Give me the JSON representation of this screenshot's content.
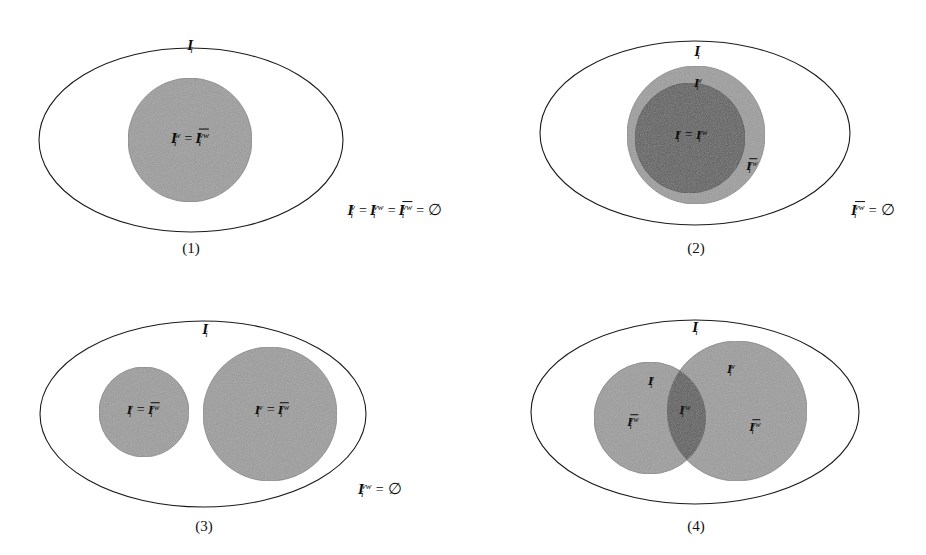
{
  "figure": {
    "background_color": "#ffffff",
    "outline_color": "#1a1a1a",
    "fill_light": "#9d9d9d",
    "fill_dark": "#5f5f5f",
    "symbols": {
      "empty_set": "∅",
      "equals": "="
    },
    "panels": [
      {
        "id": "panel-1",
        "caption": "(1)",
        "universe_label": {
          "base": "I",
          "sub": "i",
          "sup": ""
        },
        "regions": [
          {
            "name": "inner-disc",
            "label_parts": [
              {
                "base": "I",
                "sub": "i",
                "sup": "w",
                "bar": false
              },
              {
                "op": "="
              },
              {
                "base": "I",
                "sub": "i",
                "sup": "vw",
                "bar": true
              }
            ]
          }
        ],
        "side_equation": [
          {
            "base": "I",
            "sub": "i",
            "sup": "v",
            "bar": false
          },
          {
            "op": "="
          },
          {
            "base": "I",
            "sub": "i",
            "sup": "vw",
            "bar": false
          },
          {
            "op": "="
          },
          {
            "base": "I",
            "sub": "i",
            "sup": "vw",
            "bar": true
          },
          {
            "op": "="
          },
          {
            "empty": "∅"
          }
        ]
      },
      {
        "id": "panel-2",
        "caption": "(2)",
        "universe_label": {
          "base": "I",
          "sub": "i",
          "sup": ""
        },
        "regions": [
          {
            "name": "outer-ring-top",
            "label_parts": [
              {
                "base": "I",
                "sub": "i",
                "sup": "w",
                "bar": false
              }
            ]
          },
          {
            "name": "inner-disc",
            "label_parts": [
              {
                "base": "I",
                "sub": "i",
                "sup": "v",
                "bar": false
              },
              {
                "op": "="
              },
              {
                "base": "I",
                "sub": "i",
                "sup": "vw",
                "bar": false
              }
            ]
          },
          {
            "name": "outer-ring-right",
            "label_parts": [
              {
                "base": "I",
                "sub": "i",
                "sup": "vw",
                "bar": true
              }
            ]
          }
        ],
        "side_equation": [
          {
            "base": "I",
            "sub": "i",
            "sup": "vw",
            "bar": true
          },
          {
            "op": "="
          },
          {
            "empty": "∅"
          }
        ]
      },
      {
        "id": "panel-3",
        "caption": "(3)",
        "universe_label": {
          "base": "I",
          "sub": "i",
          "sup": ""
        },
        "regions": [
          {
            "name": "left-disc",
            "label_parts": [
              {
                "base": "I",
                "sub": "i",
                "sup": "v",
                "bar": false
              },
              {
                "op": "="
              },
              {
                "base": "I",
                "sub": "i",
                "sup": "vw",
                "bar": true
              }
            ]
          },
          {
            "name": "right-disc",
            "label_parts": [
              {
                "base": "I",
                "sub": "i",
                "sup": "w",
                "bar": false
              },
              {
                "op": "="
              },
              {
                "base": "I",
                "sub": "i",
                "sup": "vw",
                "bar": true
              }
            ]
          }
        ],
        "side_equation": [
          {
            "base": "I",
            "sub": "i",
            "sup": "vw",
            "bar": false
          },
          {
            "op": "="
          },
          {
            "empty": "∅"
          }
        ]
      },
      {
        "id": "panel-4",
        "caption": "(4)",
        "universe_label": {
          "base": "I",
          "sub": "i",
          "sup": ""
        },
        "regions": [
          {
            "name": "left-disc-top",
            "label_parts": [
              {
                "base": "I",
                "sub": "i",
                "sup": "v",
                "bar": false
              }
            ]
          },
          {
            "name": "left-disc-only",
            "label_parts": [
              {
                "base": "I",
                "sub": "i",
                "sup": "vw",
                "bar": true
              }
            ]
          },
          {
            "name": "intersection",
            "label_parts": [
              {
                "base": "I",
                "sub": "i",
                "sup": "vw",
                "bar": false
              }
            ]
          },
          {
            "name": "right-disc-top",
            "label_parts": [
              {
                "base": "I",
                "sub": "i",
                "sup": "w",
                "bar": false
              }
            ]
          },
          {
            "name": "right-disc-only",
            "label_parts": [
              {
                "base": "I",
                "sub": "i",
                "sup": "vw",
                "bar": true
              }
            ]
          }
        ],
        "side_equation": []
      }
    ]
  }
}
